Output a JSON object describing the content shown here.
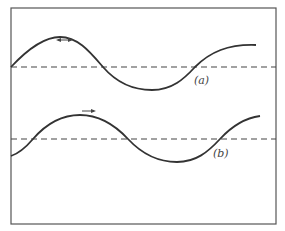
{
  "figure": {
    "frame": {
      "x": 11,
      "y": 8,
      "width": 265,
      "height": 216
    },
    "waves": [
      {
        "id": "a",
        "label": "(a)",
        "axis_y": 67,
        "direction": "left",
        "axis_crossings_x": [
          103,
          195
        ],
        "peak": [
          60,
          37
        ],
        "trough": [
          152,
          90
        ]
      },
      {
        "id": "b",
        "label": "(b)",
        "axis_y": 139,
        "direction": "right",
        "axis_crossings_x": [
          33,
          128,
          220
        ],
        "peak": [
          80,
          115
        ],
        "trough": [
          177,
          162
        ]
      }
    ],
    "colors": {
      "line": "#333333",
      "frame": "#555555",
      "background": "#ffffff"
    }
  }
}
